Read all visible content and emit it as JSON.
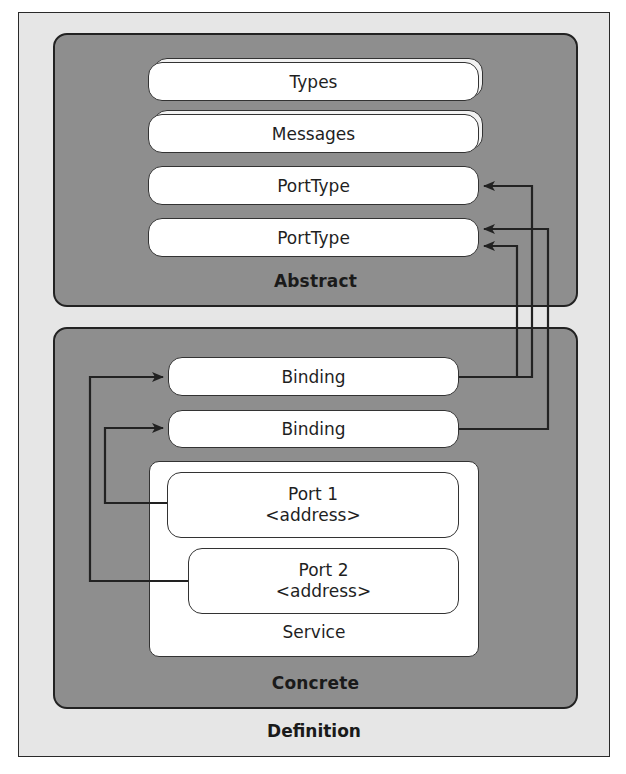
{
  "diagram": {
    "definition_label": "Definition",
    "abstract": {
      "label": "Abstract",
      "items": [
        {
          "label": "Types",
          "stacked": true
        },
        {
          "label": "Messages",
          "stacked": true
        },
        {
          "label": "PortType",
          "stacked": false
        },
        {
          "label": "PortType",
          "stacked": false
        }
      ]
    },
    "concrete": {
      "label": "Concrete",
      "bindings": [
        {
          "label": "Binding"
        },
        {
          "label": "Binding"
        }
      ],
      "service": {
        "label": "Service",
        "ports": [
          {
            "name": "Port 1",
            "address": "<address>"
          },
          {
            "name": "Port 2",
            "address": "<address>"
          }
        ]
      }
    },
    "connections": [
      {
        "from": "Binding 1",
        "to": "PortType 1"
      },
      {
        "from": "Binding 1",
        "to": "PortType 2"
      },
      {
        "from": "Binding 2",
        "to": "PortType 2"
      },
      {
        "from": "Port 1",
        "to": "Binding 2"
      },
      {
        "from": "Port 2",
        "to": "Binding 1"
      }
    ],
    "colors": {
      "definition_bg": "#e6e6e6",
      "panel_bg": "#8e8e8e",
      "box_bg": "#ffffff",
      "line": "#222222"
    }
  }
}
